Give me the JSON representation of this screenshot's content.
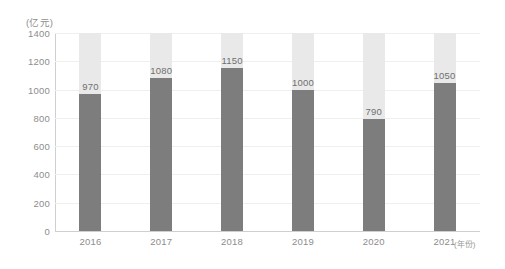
{
  "chart_data": {
    "type": "bar",
    "title": "",
    "subtitle": "",
    "xlabel": "(年份)",
    "ylabel": "(亿元)",
    "categories": [
      "2016",
      "2017",
      "2018",
      "2019",
      "2020",
      "2021"
    ],
    "values": [
      970,
      1080,
      1150,
      1000,
      790,
      1050
    ],
    "data_labels": [
      "970",
      "1080",
      "1150",
      "1000",
      "790",
      "1050"
    ],
    "ylim": [
      0,
      1400
    ],
    "yticks": [
      0,
      200,
      400,
      600,
      800,
      1000,
      1200,
      1400
    ],
    "ytick_labels": [
      "0",
      "200",
      "400",
      "600",
      "800",
      "1000",
      "1200",
      "1400"
    ],
    "grid": true,
    "legend": null,
    "legend_position": "none",
    "stacked_to_max": true,
    "series": [
      {
        "name": "数值",
        "values": [
          970,
          1080,
          1150,
          1000,
          790,
          1050
        ],
        "color": "#7d7d7d"
      },
      {
        "name": "剩余",
        "values": [
          430,
          320,
          250,
          400,
          610,
          350
        ],
        "color": "#e9e9e9"
      }
    ],
    "colors": {
      "bar_value": "#7d7d7d",
      "bar_remainder": "#e9e9e9",
      "gridline": "#eef0f0",
      "axis": "#cfcfcf",
      "tick_text": "#8d8d8d",
      "data_label_text": "#6f6f6f",
      "background": "#ffffff"
    }
  }
}
